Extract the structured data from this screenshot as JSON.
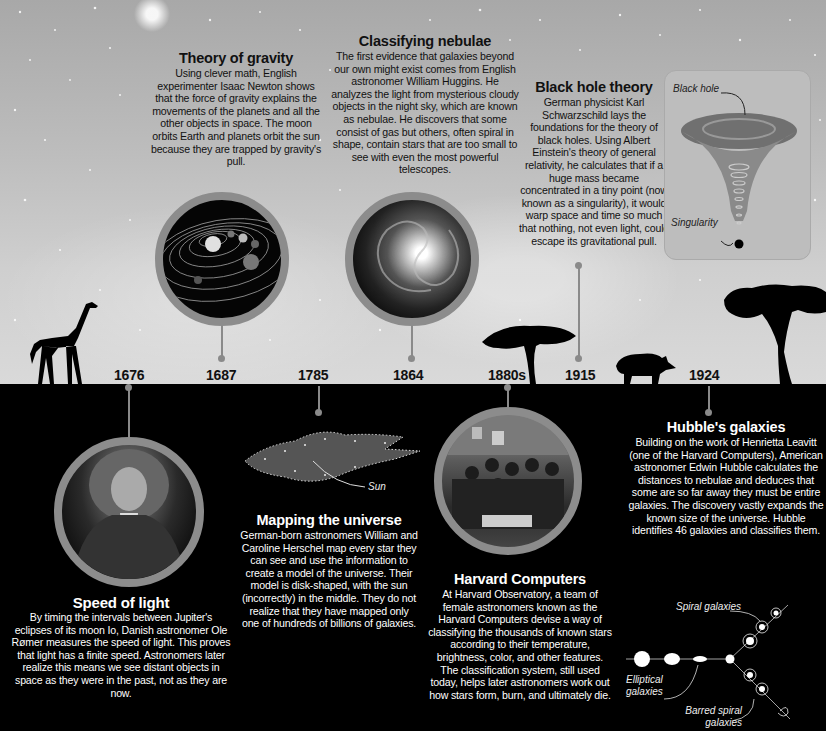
{
  "timeline": {
    "events": [
      {
        "year": "1676",
        "title": "Speed of light",
        "text": "By timing the intervals between Jupiter's eclipses of its moon Io, Danish astronomer Ole Rømer measures the speed of light. This proves that light has a finite speed. Astronomers later realize this means we see distant objects in space as they were in the past, not as they are now.",
        "image": "portrait-ole-romer"
      },
      {
        "year": "1687",
        "title": "Theory of gravity",
        "text": "Using clever math, English experimenter Isaac Newton shows that the force of gravity explains the movements of the planets and all the other objects in space. The moon orbits Earth and planets orbit the sun because they are trapped by gravity's pull.",
        "image": "solar-system-orbits"
      },
      {
        "year": "1785",
        "title": "Mapping the universe",
        "text": "German-born astronomers William and Caroline Herschel map every star they can see and use the information to create a model of the universe. Their model is disk-shaped, with the sun (incorrectly) in the middle. They do not realize that they have mapped only one of hundreds of billions of galaxies.",
        "image": "herschel-star-map",
        "label": "Sun"
      },
      {
        "year": "1864",
        "title": "Classifying nebulae",
        "text": "The first evidence that galaxies beyond our own might exist comes from English astronomer William Huggins. He analyzes the light from mysterious cloudy objects in the night sky, which are known as nebulae. He discovers that some consist of gas but others, often spiral in shape, contain stars that are too small to see with even the most powerful telescopes.",
        "image": "spiral-galaxy"
      },
      {
        "year": "1880s",
        "title": "Harvard Computers",
        "text": "At Harvard Observatory, a team of female astronomers known as the Harvard Computers devise a way of classifying the thousands of known stars according to their temperature, brightness, color, and other features. The classification system, still used today, helps later astronomers work out how stars form, burn, and ultimately die.",
        "image": "harvard-computers-photo"
      },
      {
        "year": "1915",
        "title": "Black hole theory",
        "text": "German physicist Karl Schwarzschild lays the foundations for the theory of black holes. Using Albert Einstein's theory of general relativity, he calculates that if a huge mass became concentrated in a tiny point (now known as a singularity), it would warp space and time so much that nothing, not even light, could escape its gravitational pull.",
        "diagram_labels": [
          "Black hole",
          "Singularity"
        ]
      },
      {
        "year": "1924",
        "title": "Hubble's galaxies",
        "text": "Building on the work of Henrietta Leavitt (one of the Harvard Computers), American astronomer Edwin Hubble calculates the distances to nebulae and deduces that some are so far away they must be entire galaxies. The discovery vastly expands the known size of the universe. Hubble identifies 46 galaxies and classifies them.",
        "diagram_labels": [
          "Spiral galaxies",
          "Elliptical galaxies",
          "Barred spiral galaxies"
        ]
      }
    ]
  },
  "colors": {
    "sky": "#c4c4c4",
    "ground": "#000000",
    "stem": "#8a8a8a",
    "ring": "#8c8c8c"
  }
}
